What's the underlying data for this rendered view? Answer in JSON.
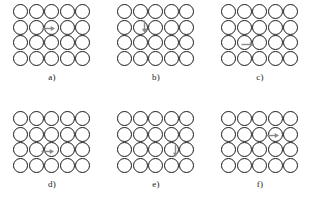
{
  "figure": {
    "type": "diagram",
    "background_color": "#ffffff",
    "circle_outline_color": "#191919",
    "arrow_color": "#8a8a8a",
    "grid": {
      "columns": 5,
      "rows": 4,
      "circle_diameter_px": 15
    }
  },
  "panels": [
    {
      "id": "a",
      "label": "a)",
      "arrow": {
        "direction": "right",
        "orientation": "horizontal",
        "row_index": 1,
        "col_index": 2,
        "left_px": 29,
        "top_px": 21,
        "length_px": 13
      }
    },
    {
      "id": "b",
      "label": "b)",
      "arrow": {
        "direction": "down",
        "orientation": "vertical",
        "row_index": 1,
        "col_index": 1,
        "left_px": 24,
        "top_px": 16,
        "length_px": 13
      }
    },
    {
      "id": "c",
      "label": "c)",
      "arrow": {
        "direction": "right",
        "orientation": "horizontal",
        "row_index": 2,
        "col_index": 1,
        "left_px": 20,
        "top_px": 37,
        "length_px": 13
      }
    },
    {
      "id": "d",
      "label": "d)",
      "arrow": {
        "direction": "right",
        "orientation": "horizontal",
        "row_index": 2,
        "col_index": 2,
        "left_px": 28,
        "top_px": 37,
        "length_px": 13
      }
    },
    {
      "id": "e",
      "label": "e)",
      "arrow": {
        "direction": "down",
        "orientation": "vertical",
        "row_index": 2,
        "col_index": 3,
        "left_px": 55,
        "top_px": 33,
        "length_px": 13
      }
    },
    {
      "id": "f",
      "label": "f)",
      "arrow": {
        "direction": "right",
        "orientation": "horizontal",
        "row_index": 1,
        "col_index": 3,
        "left_px": 45,
        "top_px": 21,
        "length_px": 13
      }
    }
  ]
}
